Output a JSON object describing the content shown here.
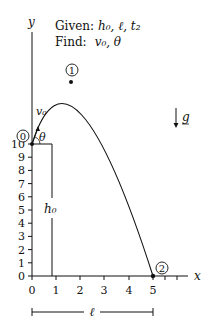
{
  "diagram": {
    "type": "projectile-motion-diagram",
    "given_label": "Given:",
    "given_values": "h₀, ℓ, t₂",
    "find_label": "Find:",
    "find_values": "v₀, θ",
    "axes": {
      "x_label": "x",
      "y_label": "y",
      "x_ticks": [
        "0",
        "1",
        "2",
        "3",
        "4",
        "5"
      ],
      "y_ticks": [
        "0",
        "1",
        "2",
        "3",
        "4",
        "5",
        "6",
        "7",
        "8",
        "9",
        "10"
      ]
    },
    "points": [
      {
        "id": "0",
        "label": "0",
        "x": 0,
        "y": 10
      },
      {
        "id": "1",
        "label": "1",
        "x": 1.6,
        "y": 14.7
      },
      {
        "id": "2",
        "label": "2",
        "x": 5,
        "y": 0
      }
    ],
    "vectors": {
      "velocity_label": "v₀",
      "angle_label": "θ",
      "gravity_label": "g"
    },
    "dimensions": {
      "height_label": "h₀",
      "length_label": "ℓ"
    },
    "colors": {
      "stroke": "#111111",
      "background": "#ffffff"
    }
  }
}
